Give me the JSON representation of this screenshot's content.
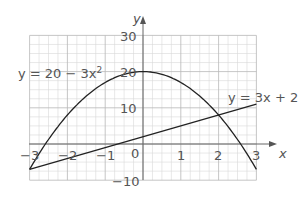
{
  "chart_data": {
    "type": "line",
    "title": "",
    "xlabel": "x",
    "ylabel": "y",
    "xlim": [
      -3,
      3
    ],
    "ylim": [
      -10,
      30
    ],
    "grid": true,
    "x_ticks": [
      "-3",
      "-2",
      "-1",
      "0",
      "1",
      "2",
      "3"
    ],
    "y_ticks": [
      "30",
      "20",
      "10",
      "-10"
    ],
    "series": [
      {
        "name": "y = 20 − 3x²",
        "label": "y = 20 − 3x",
        "label_sup": "2",
        "function": "20 - 3*x^2",
        "x": [
          -3,
          -2.5,
          -2,
          -1.5,
          -1,
          -0.5,
          0,
          0.5,
          1,
          1.5,
          2,
          2.5,
          3
        ],
        "values": [
          -7,
          1.25,
          8,
          13.25,
          17,
          19.25,
          20,
          19.25,
          17,
          13.25,
          8,
          1.25,
          -7
        ]
      },
      {
        "name": "y = 3x + 2",
        "label": "y = 3x + 2",
        "function": "3*x + 2",
        "x": [
          -3,
          3
        ],
        "values": [
          -7,
          11
        ]
      }
    ],
    "intersections": [
      [
        -3,
        -7
      ],
      [
        2,
        8
      ]
    ]
  },
  "labels": {
    "axis_x": "x",
    "axis_y": "y",
    "curve_label": "y = 20 − 3x",
    "curve_sup": "2",
    "line_label": "y = 3x + 2",
    "tick_x_m3": "−3",
    "tick_x_m2": "−2",
    "tick_x_m1": "−1",
    "tick_x_0": "0",
    "tick_x_1": "1",
    "tick_x_2": "2",
    "tick_x_3": "3",
    "tick_y_30": "30",
    "tick_y_20": "20",
    "tick_y_10": "10",
    "tick_y_m10": "−10"
  }
}
